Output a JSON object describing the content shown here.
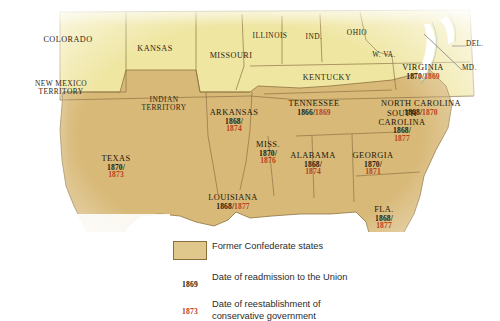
{
  "map": {
    "colors": {
      "confederate_fill": "#d8b978",
      "union_fill": "#efe6a2",
      "water": "#ffffff",
      "border": "#8d7340",
      "date_readmission": "#241a0e",
      "date_conservative": "#b8401f"
    },
    "confederate_states": [
      {
        "id": "texas",
        "name": "TEXAS",
        "readmission": "1870/",
        "conservative": "1873",
        "stack": 2
      },
      {
        "id": "arkansas",
        "name": "ARKANSAS",
        "readmission": "1868/",
        "conservative": "1874",
        "stack": 2
      },
      {
        "id": "louisiana",
        "name": "LOUISIANA",
        "readmission": "1868/",
        "conservative": "1877",
        "stack": 1
      },
      {
        "id": "mississippi",
        "name": "MISS.",
        "readmission": "1870/",
        "conservative": "1876",
        "stack": 2
      },
      {
        "id": "alabama",
        "name": "ALABAMA",
        "readmission": "1868/",
        "conservative": "1874",
        "stack": 2
      },
      {
        "id": "georgia",
        "name": "GEORGIA",
        "readmission": "1870/",
        "conservative": "1871",
        "stack": 2
      },
      {
        "id": "florida",
        "name": "FLA.",
        "readmission": "1868/",
        "conservative": "1877",
        "stack": 2
      },
      {
        "id": "tennessee",
        "name": "TENNESSEE",
        "readmission": "1866/",
        "conservative": "1869",
        "stack": 1
      },
      {
        "id": "south-carolina",
        "name": "SOUTH CAROLINA",
        "readmission": "1868/",
        "conservative": "1877",
        "stack": 2
      },
      {
        "id": "north-carolina",
        "name": "NORTH CAROLINA",
        "readmission": "1868/",
        "conservative": "1870",
        "stack": 1
      },
      {
        "id": "virginia",
        "name": "VIRGINIA",
        "readmission": "1870/",
        "conservative": "1869",
        "stack": 1
      }
    ],
    "other_regions": [
      {
        "id": "colorado",
        "name": "COLORADO"
      },
      {
        "id": "kansas",
        "name": "KANSAS"
      },
      {
        "id": "missouri",
        "name": "MISSOURI"
      },
      {
        "id": "illinois",
        "name": "ILLINOIS"
      },
      {
        "id": "indiana",
        "name": "IND."
      },
      {
        "id": "ohio",
        "name": "OHIO"
      },
      {
        "id": "west-virginia",
        "name": "W. VA."
      },
      {
        "id": "kentucky",
        "name": "KENTUCKY"
      },
      {
        "id": "new-mexico-territory",
        "name": "NEW MEXICO TERRITORY"
      },
      {
        "id": "indian-territory",
        "name": "INDIAN TERRITORY"
      },
      {
        "id": "delaware",
        "name": "DEL."
      },
      {
        "id": "maryland",
        "name": "MD."
      }
    ]
  },
  "legend": {
    "swatch_label": "Former Confederate states",
    "readmission_key": "1869",
    "readmission_label": "Date of readmission to the Union",
    "conservative_key": "1873",
    "conservative_label_line1": "Date of reestablishment of",
    "conservative_label_line2": "conservative government"
  }
}
